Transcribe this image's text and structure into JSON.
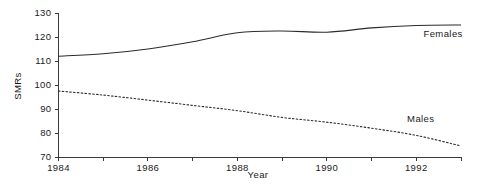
{
  "chart_data": {
    "type": "line",
    "title": "",
    "subtitle": "",
    "xlabel": "Year",
    "ylabel": "SMRs",
    "xlim": [
      1984,
      1993
    ],
    "ylim": [
      70,
      130
    ],
    "grid": false,
    "legend_position": "inline-right",
    "x_tick_labels": [
      "1984",
      "1986",
      "1988",
      "1990",
      "1992"
    ],
    "x_tick_values": [
      1984,
      1986,
      1988,
      1990,
      1992
    ],
    "x_minor_tick_values": [
      1985,
      1987,
      1989,
      1991,
      1993
    ],
    "y_tick_labels": [
      "70",
      "80",
      "90",
      "100",
      "110",
      "120",
      "130"
    ],
    "y_tick_values": [
      70,
      80,
      90,
      100,
      110,
      120,
      130
    ],
    "x": [
      1984,
      1985,
      1986,
      1987,
      1988,
      1989,
      1990,
      1991,
      1992,
      1993
    ],
    "series": [
      {
        "name": "Females",
        "style": "solid",
        "values": [
          112.0,
          113.0,
          115.0,
          118.0,
          121.8,
          122.5,
          122.0,
          123.8,
          124.8,
          125.0
        ]
      },
      {
        "name": "Males",
        "style": "dotted",
        "values": [
          97.5,
          95.8,
          93.7,
          91.5,
          89.3,
          86.5,
          84.5,
          82.0,
          79.0,
          74.6
        ]
      }
    ],
    "annotations": [
      {
        "text": "Females",
        "x": 1992.6,
        "y": 120.0
      },
      {
        "text": "Males",
        "x": 1992.1,
        "y": 84.5
      }
    ]
  },
  "axes": {
    "y_axis_title": "SMRs",
    "x_axis_title": "Year"
  },
  "colors": {
    "background": "#ffffff",
    "axis": "#3a3a3a",
    "series_line": "#2b2b2b",
    "text": "#1a1a1a"
  }
}
